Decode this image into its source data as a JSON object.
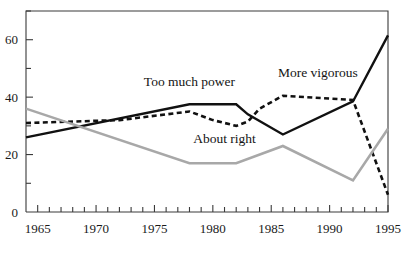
{
  "chart_data": {
    "type": "line",
    "title": "",
    "subtitle": "",
    "xlabel": "",
    "ylabel": "",
    "xlim": [
      1964,
      1995
    ],
    "ylim": [
      0,
      70
    ],
    "grid": false,
    "legend_position": "inline-annotations",
    "y_ticks_labeled": [
      0,
      20,
      40,
      60
    ],
    "y_ticks_minor": [
      10,
      30,
      50,
      70
    ],
    "x_ticks_labeled": [
      1965,
      1970,
      1975,
      1980,
      1985,
      1990,
      1995
    ],
    "x_ticks_minor_every": 1,
    "x_tick_label_text": [
      "1965",
      "1970",
      "1975",
      "1980",
      "1985",
      "1990",
      "1995"
    ],
    "y_tick_label_text": [
      "0",
      "20",
      "40",
      "60"
    ],
    "series": [
      {
        "name": "Too much power",
        "style": "solid",
        "color": "#111111",
        "label_text": "Too much power",
        "x": [
          1964,
          1978,
          1982,
          1983,
          1986,
          1992,
          1995
        ],
        "values": [
          26,
          37.5,
          37.5,
          34,
          27,
          38.5,
          61.5
        ]
      },
      {
        "name": "More vigorous",
        "style": "dashed",
        "color": "#111111",
        "label_text": "More vigorous",
        "x": [
          1964,
          1972,
          1978,
          1980,
          1982,
          1983,
          1984,
          1986,
          1992,
          1995
        ],
        "values": [
          31,
          32,
          35,
          32,
          30,
          31.5,
          36,
          40.5,
          39,
          6
        ]
      },
      {
        "name": "About right",
        "style": "solid",
        "color": "#a8a8a8",
        "label_text": "About right",
        "x": [
          1964,
          1978,
          1982,
          1986,
          1992,
          1995
        ],
        "values": [
          36,
          17,
          17,
          23,
          11,
          29
        ]
      }
    ],
    "annotations": [
      {
        "text": "Too much power",
        "x": 1978,
        "y": 44
      },
      {
        "text": "More vigorous",
        "x": 1989,
        "y": 47
      },
      {
        "text": "About right",
        "x": 1981,
        "y": 24
      }
    ]
  },
  "colors": {
    "axis": "#3a3a3a",
    "solid_black": "#111111",
    "gray_series": "#a8a8a8",
    "background": "#ffffff",
    "text": "#141414"
  }
}
